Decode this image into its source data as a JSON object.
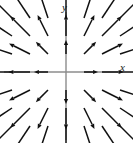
{
  "figure": {
    "title": "",
    "background_color": "#ffffff",
    "width": 133,
    "height": 143
  },
  "axes": {
    "x_label": "x",
    "y_label": "y",
    "axis_color": "#8c8c8c",
    "arrow_color": "#111111"
  },
  "chart_data": {
    "type": "quiver",
    "title": "",
    "xlabel": "x",
    "ylabel": "y",
    "xlim": [
      -3,
      3
    ],
    "ylim": [
      -3,
      3
    ],
    "grid": false,
    "legend": null,
    "vector_formula": "F(x, y) = (x, y)",
    "origin": {
      "x": 0,
      "y": 0
    },
    "grid_x": [
      -3,
      -2,
      -1,
      0,
      1,
      2,
      3
    ],
    "grid_y": [
      -3,
      -2,
      -1,
      0,
      1,
      2,
      3
    ],
    "pixel_origin": {
      "x": 66,
      "y": 72
    },
    "pixel_spacing": 18,
    "length_scale": 0.42,
    "head_length": 5.0,
    "head_width": 4.2,
    "shaft_width": 1.5,
    "vectors": [
      {
        "x": -3,
        "y": 3,
        "u": -3,
        "v": 3
      },
      {
        "x": -2,
        "y": 3,
        "u": -2,
        "v": 3
      },
      {
        "x": -1,
        "y": 3,
        "u": -1,
        "v": 3
      },
      {
        "x": 0,
        "y": 3,
        "u": 0,
        "v": 3
      },
      {
        "x": 1,
        "y": 3,
        "u": 1,
        "v": 3
      },
      {
        "x": 2,
        "y": 3,
        "u": 2,
        "v": 3
      },
      {
        "x": 3,
        "y": 3,
        "u": 3,
        "v": 3
      },
      {
        "x": -3,
        "y": 2,
        "u": -3,
        "v": 2
      },
      {
        "x": -2,
        "y": 2,
        "u": -2,
        "v": 2
      },
      {
        "x": -1,
        "y": 2,
        "u": -1,
        "v": 2
      },
      {
        "x": 0,
        "y": 2,
        "u": 0,
        "v": 2
      },
      {
        "x": 1,
        "y": 2,
        "u": 1,
        "v": 2
      },
      {
        "x": 2,
        "y": 2,
        "u": 2,
        "v": 2
      },
      {
        "x": 3,
        "y": 2,
        "u": 3,
        "v": 2
      },
      {
        "x": -3,
        "y": 1,
        "u": -3,
        "v": 1
      },
      {
        "x": -2,
        "y": 1,
        "u": -2,
        "v": 1
      },
      {
        "x": -1,
        "y": 1,
        "u": -1,
        "v": 1
      },
      {
        "x": 0,
        "y": 1,
        "u": 0,
        "v": 1
      },
      {
        "x": 1,
        "y": 1,
        "u": 1,
        "v": 1
      },
      {
        "x": 2,
        "y": 1,
        "u": 2,
        "v": 1
      },
      {
        "x": 3,
        "y": 1,
        "u": 3,
        "v": 1
      },
      {
        "x": -3,
        "y": 0,
        "u": -3,
        "v": 0
      },
      {
        "x": -2,
        "y": 0,
        "u": -2,
        "v": 0
      },
      {
        "x": -1,
        "y": 0,
        "u": -1,
        "v": 0
      },
      {
        "x": 1,
        "y": 0,
        "u": 1,
        "v": 0
      },
      {
        "x": 2,
        "y": 0,
        "u": 2,
        "v": 0
      },
      {
        "x": 3,
        "y": 0,
        "u": 3,
        "v": 0
      },
      {
        "x": -3,
        "y": -1,
        "u": -3,
        "v": -1
      },
      {
        "x": -2,
        "y": -1,
        "u": -2,
        "v": -1
      },
      {
        "x": -1,
        "y": -1,
        "u": -1,
        "v": -1
      },
      {
        "x": 0,
        "y": -1,
        "u": 0,
        "v": -1
      },
      {
        "x": 1,
        "y": -1,
        "u": 1,
        "v": -1
      },
      {
        "x": 2,
        "y": -1,
        "u": 2,
        "v": -1
      },
      {
        "x": 3,
        "y": -1,
        "u": 3,
        "v": -1
      },
      {
        "x": -3,
        "y": -2,
        "u": -3,
        "v": -2
      },
      {
        "x": -2,
        "y": -2,
        "u": -2,
        "v": -2
      },
      {
        "x": -1,
        "y": -2,
        "u": -1,
        "v": -2
      },
      {
        "x": 0,
        "y": -2,
        "u": 0,
        "v": -2
      },
      {
        "x": 1,
        "y": -2,
        "u": 1,
        "v": -2
      },
      {
        "x": 2,
        "y": -2,
        "u": 2,
        "v": -2
      },
      {
        "x": 3,
        "y": -2,
        "u": 3,
        "v": -2
      },
      {
        "x": -3,
        "y": -3,
        "u": -3,
        "v": -3
      },
      {
        "x": -2,
        "y": -3,
        "u": -2,
        "v": -3
      },
      {
        "x": -1,
        "y": -3,
        "u": -1,
        "v": -3
      },
      {
        "x": 0,
        "y": -3,
        "u": 0,
        "v": -3
      },
      {
        "x": 1,
        "y": -3,
        "u": 1,
        "v": -3
      },
      {
        "x": 2,
        "y": -3,
        "u": 2,
        "v": -3
      },
      {
        "x": 3,
        "y": -3,
        "u": 3,
        "v": -3
      }
    ]
  }
}
